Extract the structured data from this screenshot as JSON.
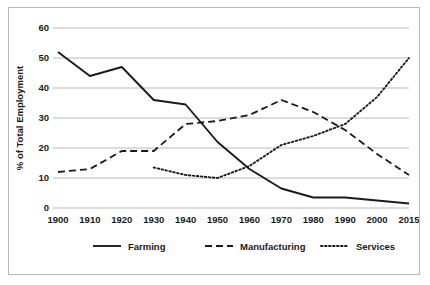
{
  "chart_data": {
    "type": "line",
    "title": "",
    "xlabel": "",
    "ylabel": "% of Total Employment",
    "xlim": [
      1900,
      2015
    ],
    "ylim": [
      0,
      60
    ],
    "grid": true,
    "legend_position": "bottom",
    "x_tick_labels": [
      "1900",
      "1910",
      "1920",
      "1930",
      "1940",
      "1950",
      "1960",
      "1970",
      "1980",
      "1990",
      "2000",
      "2015"
    ],
    "y_tick_labels": [
      "0",
      "10",
      "20",
      "30",
      "40",
      "50",
      "60"
    ],
    "y_ticks": [
      0,
      10,
      20,
      30,
      40,
      50,
      60
    ],
    "categories": [
      1900,
      1910,
      1920,
      1930,
      1940,
      1950,
      1960,
      1970,
      1980,
      1990,
      2000,
      2015
    ],
    "series": [
      {
        "name": "Farming",
        "style": "solid",
        "color": "#1a1a1a",
        "x": [
          1900,
          1910,
          1920,
          1930,
          1940,
          1950,
          1960,
          1970,
          1980,
          1990,
          2000,
          2015
        ],
        "values": [
          52,
          44,
          47,
          36,
          34.5,
          22,
          13,
          6.5,
          3.5,
          3.5,
          2.5,
          1.5
        ]
      },
      {
        "name": "Manufacturing",
        "style": "dashed",
        "color": "#1a1a1a",
        "x": [
          1900,
          1910,
          1920,
          1930,
          1940,
          1950,
          1960,
          1970,
          1980,
          1990,
          2000,
          2015
        ],
        "values": [
          12,
          13,
          19,
          19,
          28,
          29,
          31,
          36,
          32,
          26,
          18,
          11
        ]
      },
      {
        "name": "Services",
        "style": "dotted",
        "color": "#1a1a1a",
        "x": [
          1930,
          1940,
          1950,
          1960,
          1970,
          1980,
          1990,
          2000,
          2015
        ],
        "values": [
          13.5,
          11,
          10,
          14,
          21,
          24,
          28,
          37,
          50
        ]
      }
    ],
    "legend": [
      {
        "label": "Farming",
        "style": "solid"
      },
      {
        "label": "Manufacturing",
        "style": "dashed"
      },
      {
        "label": "Services",
        "style": "dotted"
      }
    ]
  }
}
